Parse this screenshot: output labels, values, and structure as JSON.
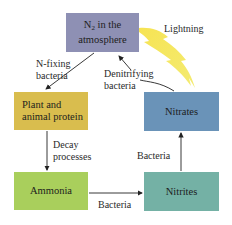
{
  "diagram": {
    "type": "nitrogen-cycle",
    "nodes": [
      {
        "id": "n2",
        "label_main": "N",
        "label_sub": "2",
        "label_rest": " in the",
        "label_line2": "atmosphere",
        "color": "#8e90b4"
      },
      {
        "id": "plant",
        "label_line1": "Plant and",
        "label_line2": "animal protein",
        "color": "#d9bd4e"
      },
      {
        "id": "nitrates",
        "label": "Nitrates",
        "color": "#6a93b8"
      },
      {
        "id": "ammonia",
        "label": "Ammonia",
        "color": "#a9cf5c"
      },
      {
        "id": "nitrites",
        "label": "Nitrites",
        "color": "#74b1a5"
      }
    ],
    "edges": [
      {
        "from": "n2",
        "to": "plant",
        "label_line1": "N-fixing",
        "label_line2": "bacteria"
      },
      {
        "from": "plant",
        "to": "ammonia",
        "label_line1": "Decay",
        "label_line2": "processes"
      },
      {
        "from": "ammonia",
        "to": "nitrites",
        "label": "Bacteria"
      },
      {
        "from": "nitrites",
        "to": "nitrates",
        "label": "Bacteria"
      },
      {
        "from": "nitrates",
        "to": "n2",
        "label_line1": "Denitrifying",
        "label_line2": "bacteria"
      },
      {
        "from": "n2",
        "to": "nitrates",
        "label": "Lightning",
        "style": "lightning-bolt",
        "color": "#f2e33a"
      }
    ]
  }
}
